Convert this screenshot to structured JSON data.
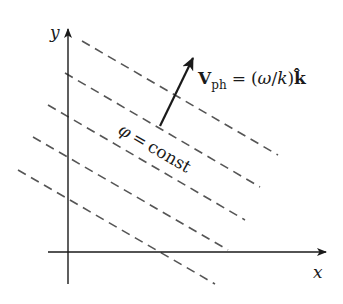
{
  "axes": {
    "x_label": "x",
    "y_label": "y",
    "color": "#1a1a1a"
  },
  "wavefronts": {
    "label_lhs": "φ",
    "label_eq": "=",
    "label_rhs": "const",
    "style": "dashed",
    "color": "#555555",
    "count": 5,
    "lines": [
      {
        "x1": 82,
        "y1": 41,
        "x2": 278,
        "y2": 155
      },
      {
        "x1": 65,
        "y1": 73,
        "x2": 260,
        "y2": 187
      },
      {
        "x1": 48,
        "y1": 105,
        "x2": 245,
        "y2": 220
      },
      {
        "x1": 33,
        "y1": 137,
        "x2": 228,
        "y2": 250
      },
      {
        "x1": 18,
        "y1": 170,
        "x2": 215,
        "y2": 284
      }
    ]
  },
  "phase_velocity": {
    "symbol": "V",
    "subscript": "ph",
    "equals": "=",
    "expression_open": "(",
    "omega": "ω",
    "slash": "/",
    "k": "k",
    "expression_close": ")",
    "unit_vector": "k̂",
    "arrow": {
      "x1": 160,
      "y1": 126,
      "x2": 193,
      "y2": 58
    }
  }
}
